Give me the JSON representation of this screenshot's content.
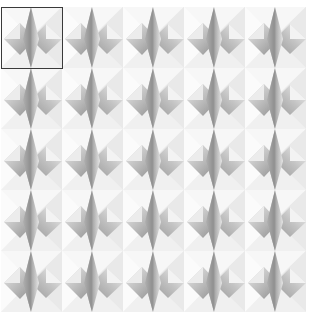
{
  "pattern": {
    "name": "pyramid-star-tile",
    "tile_size": 61,
    "columns": 5,
    "rows": 5,
    "background": "#ffffff",
    "facet_light": "#f2f2f2",
    "facet_mid": "#c8c8c8",
    "facet_dark": "#8a8a8a"
  },
  "selection": {
    "tile_index": 0,
    "border_color": "#3a3a3a"
  }
}
